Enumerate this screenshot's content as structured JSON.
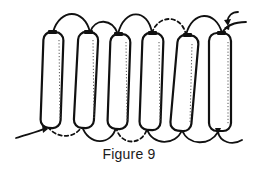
{
  "figure": {
    "caption": "Figure 9",
    "bead_count": 6,
    "colors": {
      "line": "#111111",
      "background": "#ffffff"
    },
    "top_arcs": [
      {
        "from": 1,
        "to": 2,
        "style": "solid"
      },
      {
        "from": 2,
        "to": 3,
        "style": "solid"
      },
      {
        "from": 3,
        "to": 4,
        "style": "solid"
      },
      {
        "from": 4,
        "to": 5,
        "style": "dashed"
      },
      {
        "from": 5,
        "to": 6,
        "style": "solid"
      }
    ],
    "bottom_arcs": [
      {
        "from": 1,
        "to": 2,
        "style": "dashed"
      },
      {
        "from": 2,
        "to": 3,
        "style": "solid"
      },
      {
        "from": 3,
        "to": 4,
        "style": "dashed"
      },
      {
        "from": 4,
        "to": 5,
        "style": "solid"
      },
      {
        "from": 5,
        "to": 6,
        "style": "solid"
      }
    ],
    "arrows": [
      {
        "location": "bottom-left",
        "meaning": "thread-entry"
      },
      {
        "location": "top-right",
        "meaning": "needle-direction"
      }
    ]
  }
}
